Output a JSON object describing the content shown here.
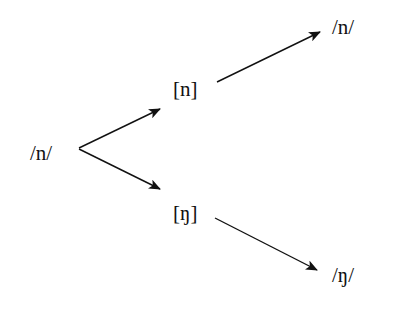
{
  "diagram": {
    "source": {
      "label": "/n/"
    },
    "middle": [
      {
        "label": "[n]"
      },
      {
        "label": "[ŋ]"
      }
    ],
    "targets": [
      {
        "label": "/n/"
      },
      {
        "label": "/ŋ/"
      }
    ],
    "edges": [
      {
        "from": "/n/",
        "to": "[n]"
      },
      {
        "from": "/n/",
        "to": "[ŋ]"
      },
      {
        "from": "[n]",
        "to": "/n/"
      },
      {
        "from": "[ŋ]",
        "to": "/ŋ/"
      }
    ]
  }
}
